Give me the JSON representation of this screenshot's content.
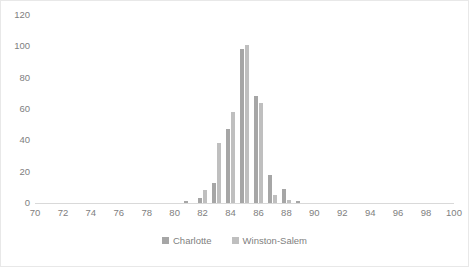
{
  "chart_data": {
    "type": "bar",
    "title": "",
    "subtitle": "",
    "xlabel": "",
    "ylabel": "",
    "xlim": [
      70,
      100
    ],
    "ylim": [
      0,
      120
    ],
    "grid": false,
    "legend_position": "bottom",
    "x_ticks": [
      70,
      72,
      74,
      76,
      78,
      80,
      82,
      84,
      86,
      88,
      90,
      92,
      94,
      96,
      98,
      100
    ],
    "y_ticks": [
      0,
      20,
      40,
      60,
      80,
      100,
      120
    ],
    "x": [
      81,
      82,
      83,
      84,
      85,
      86,
      87,
      88,
      89
    ],
    "series": [
      {
        "name": "Charlotte",
        "color": "#a6a6a6",
        "values": [
          1,
          3,
          13,
          47,
          98,
          68,
          18,
          9,
          1
        ]
      },
      {
        "name": "Winston-Salem",
        "color": "#bfbfbf",
        "values": [
          0,
          8,
          38,
          58,
          101,
          64,
          5,
          2,
          0
        ]
      }
    ],
    "legend": [
      "Charlotte",
      "Winston-Salem"
    ]
  }
}
